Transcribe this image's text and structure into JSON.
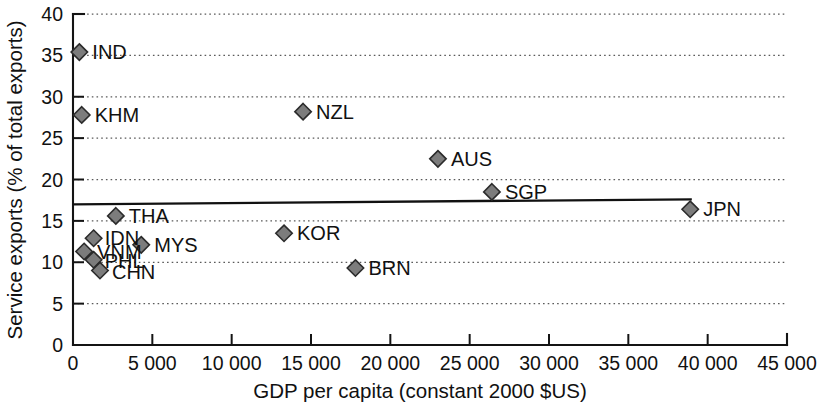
{
  "chart_data": {
    "type": "scatter",
    "title": "",
    "xlabel": "GDP per capita (constant 2000 $US)",
    "ylabel": "Service exports (% of total exports)",
    "xlim": [
      0,
      45000
    ],
    "ylim": [
      0,
      40
    ],
    "xticks": [
      0,
      5000,
      10000,
      15000,
      20000,
      25000,
      30000,
      35000,
      40000,
      45000
    ],
    "xticklabels": [
      "0",
      "5 000",
      "10 000",
      "15 000",
      "20 000",
      "25 000",
      "30 000",
      "35 000",
      "40 000",
      "45 000"
    ],
    "yticks": [
      0,
      5,
      10,
      15,
      20,
      25,
      30,
      35,
      40
    ],
    "yticklabels": [
      "0",
      "5",
      "10",
      "15",
      "20",
      "25",
      "30",
      "35",
      "40"
    ],
    "grid": "horizontal-dotted",
    "legend": "none",
    "marker": "diamond",
    "marker_color": "#7c7c7c",
    "marker_edge_color": "#2b2b2b",
    "points": [
      {
        "label": "IND",
        "x": 400,
        "y": 35.4,
        "label_dx": 13,
        "label_dy": 7
      },
      {
        "label": "KHM",
        "x": 550,
        "y": 27.8,
        "label_dx": 13,
        "label_dy": 7
      },
      {
        "label": "NZL",
        "x": 14500,
        "y": 28.2,
        "label_dx": 13,
        "label_dy": 7
      },
      {
        "label": "AUS",
        "x": 23000,
        "y": 22.5,
        "label_dx": 13,
        "label_dy": 7
      },
      {
        "label": "SGP",
        "x": 26400,
        "y": 18.5,
        "label_dx": 13,
        "label_dy": 7
      },
      {
        "label": "JPN",
        "x": 38900,
        "y": 16.4,
        "label_dx": 13,
        "label_dy": 7
      },
      {
        "label": "THA",
        "x": 2700,
        "y": 15.6,
        "label_dx": 13,
        "label_dy": 7
      },
      {
        "label": "KOR",
        "x": 13300,
        "y": 13.5,
        "label_dx": 13,
        "label_dy": 7
      },
      {
        "label": "IDN",
        "x": 1300,
        "y": 12.9,
        "label_dx": 11,
        "label_dy": 7
      },
      {
        "label": "MYS",
        "x": 4300,
        "y": 12.1,
        "label_dx": 13,
        "label_dy": 7
      },
      {
        "label": "VNM",
        "x": 700,
        "y": 11.3,
        "label_dx": 13,
        "label_dy": 8
      },
      {
        "label": "PHL",
        "x": 1300,
        "y": 10.3,
        "label_dx": 11,
        "label_dy": 8
      },
      {
        "label": "CHN",
        "x": 1700,
        "y": 9.0,
        "label_dx": 12,
        "label_dy": 8
      },
      {
        "label": "BRN",
        "x": 17800,
        "y": 9.3,
        "label_dx": 13,
        "label_dy": 7
      }
    ],
    "trendline": {
      "x_start": 0,
      "y_start": 17.0,
      "x_end": 39000,
      "y_end": 17.6
    }
  }
}
